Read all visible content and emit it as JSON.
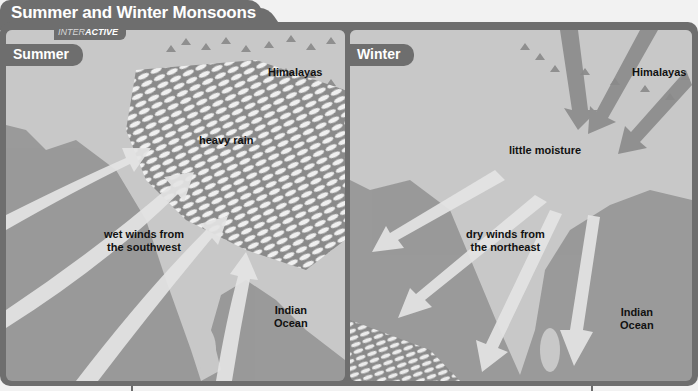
{
  "header": {
    "title": "Summer and Winter Monsoons",
    "badge_prefix": "INTER",
    "badge_bold": "ACTIVE"
  },
  "panels": {
    "summer": {
      "tab_label": "Summer",
      "labels": {
        "mountains": "Himalayas",
        "rain": "heavy rain",
        "winds_line1": "wet winds from",
        "winds_line2": "the southwest",
        "ocean_line1": "Indian",
        "ocean_line2": "Ocean"
      },
      "wind_direction": "southwest to northeast (onto land)"
    },
    "winter": {
      "tab_label": "Winter",
      "labels": {
        "mountains": "Himalayas",
        "moisture": "little moisture",
        "winds_line1": "dry winds from",
        "winds_line2": "the northeast",
        "ocean_line1": "Indian",
        "ocean_line2": "Ocean"
      },
      "wind_direction": "northeast to southwest (out to sea)"
    }
  },
  "colors": {
    "frame": "#6e6e6e",
    "land": "#c4c4c4",
    "sea": "#9a9a9a",
    "arrow": "#e4e4e4",
    "text": "#111111"
  }
}
